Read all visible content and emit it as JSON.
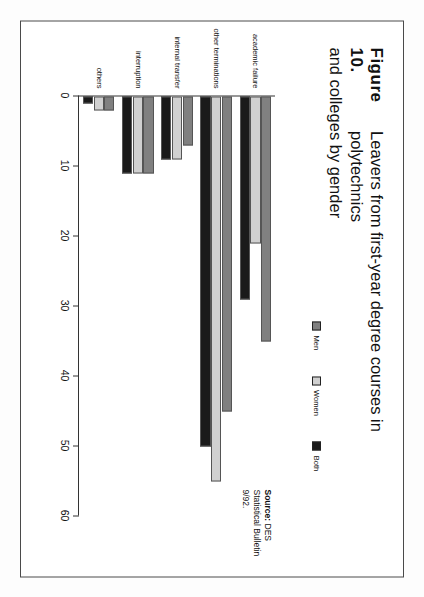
{
  "figure": {
    "number_label": "Figure 10.",
    "title_line1": "Leavers from first-year degree courses in polytechnics",
    "title_line2": "and colleges by gender",
    "source_label": "Source:",
    "source_value": " DES",
    "source_line2": "Statistical Bulletin",
    "source_line3": "9/92."
  },
  "legend": {
    "items": [
      {
        "label": "Men",
        "color": "#808080"
      },
      {
        "label": "Women",
        "color": "#d0d0d0"
      },
      {
        "label": "Both",
        "color": "#1a1a1a"
      }
    ]
  },
  "chart_data": {
    "type": "bar",
    "orientation": "horizontal",
    "title": "Leavers from first-year degree courses in polytechnics and colleges by gender",
    "xlabel": "",
    "ylabel": "",
    "xlim": [
      0,
      60
    ],
    "grid": false,
    "legend_position": "top-right",
    "categories": [
      "academic failure",
      "other terminations",
      "internal transfer",
      "interruption",
      "others"
    ],
    "tick_labels": [
      "0",
      "10",
      "20",
      "30",
      "40",
      "50",
      "60"
    ],
    "tick_values": [
      0,
      10,
      20,
      30,
      40,
      50,
      60
    ],
    "series": [
      {
        "name": "Men",
        "color": "#808080",
        "values": [
          35,
          45,
          7,
          11,
          2
        ]
      },
      {
        "name": "Women",
        "color": "#d0d0d0",
        "values": [
          21,
          55,
          9,
          11,
          2
        ]
      },
      {
        "name": "Both",
        "color": "#1a1a1a",
        "values": [
          29,
          50,
          9,
          11,
          1
        ]
      }
    ]
  }
}
